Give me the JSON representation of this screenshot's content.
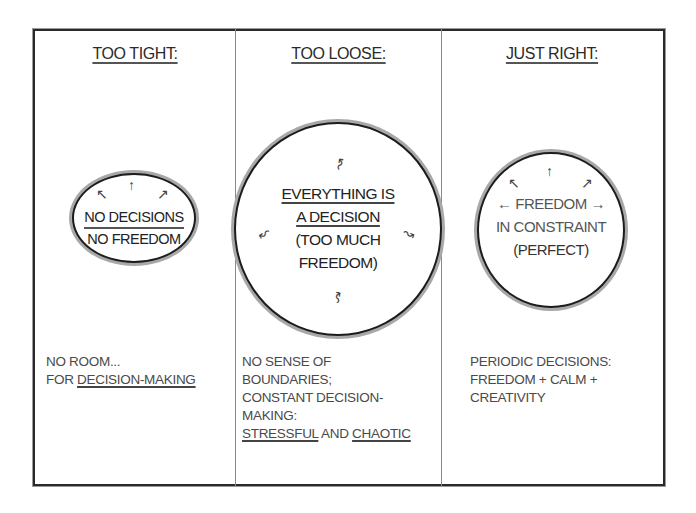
{
  "diagram": {
    "columns": [
      {
        "title": "TOO TIGHT:",
        "circle": {
          "lines": [
            "NO DECISIONS",
            "NO FREEDOM"
          ],
          "arrows": [
            "↖",
            "↑",
            "↗"
          ]
        },
        "description": {
          "line1": "NO ROOM...",
          "line2_prefix": "FOR ",
          "line2_underlined": "DECISION-MAKING"
        }
      },
      {
        "title": "TOO LOOSE:",
        "circle": {
          "lines": [
            "EVERYTHING IS",
            "A DECISION",
            "(TOO MUCH",
            "FREEDOM)"
          ],
          "arrows": [
            "↝",
            "↜",
            "↝",
            "↜"
          ]
        },
        "description": {
          "line1": "NO SENSE OF",
          "line2": "BOUNDARIES;",
          "line3": "CONSTANT DECISION-",
          "line4": "MAKING:",
          "line5_underlined_a": "STRESSFUL",
          "line5_mid": " AND ",
          "line5_underlined_b": "CHAOTIC"
        }
      },
      {
        "title": "JUST RIGHT:",
        "circle": {
          "arrow_left": "←",
          "line1": "FREEDOM",
          "arrow_right": "→",
          "line2": "IN CONSTRAINT",
          "line3": "(PERFECT)",
          "arrows": [
            "↖",
            "↑",
            "↗"
          ]
        },
        "description": {
          "line1": "PERIODIC DECISIONS:",
          "line2": "FREEDOM + CALM +",
          "line3": "CREATIVITY"
        }
      }
    ],
    "colors": {
      "frame": "#2a2a2a",
      "ring_shadow": "#a8a8a8",
      "dark_text": "#222222",
      "gray_text": "#4a4a4a"
    }
  }
}
